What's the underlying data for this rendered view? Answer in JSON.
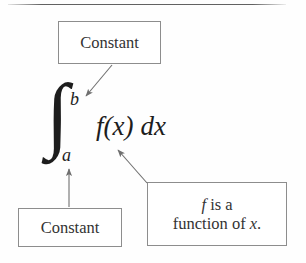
{
  "figure": {
    "background_color": "#fefefe",
    "rule_color": "#4a4a4a",
    "box_border_color": "#8d8d8d",
    "arrow_color": "#6f6f6f",
    "text_color": "#2b2b2b"
  },
  "expression": {
    "integral_sign": "∫",
    "upper_limit": "b",
    "lower_limit": "a",
    "integrand": "f(x)",
    "differential": "dx"
  },
  "callouts": {
    "upper_limit": {
      "label": "Constant",
      "lines": [
        "Constant"
      ]
    },
    "lower_limit": {
      "label": "Constant",
      "lines": [
        "Constant"
      ]
    },
    "integrand": {
      "label": "f is a function of x.",
      "lines": [
        "f is a",
        "function of x."
      ],
      "line1_italic": "f",
      "line1_rest": " is a",
      "line2_rest": "function of ",
      "line2_italic": "x",
      "line2_period": "."
    }
  },
  "arrows": [
    {
      "name": "arrow-upper-limit",
      "from": "Constant box (top)",
      "to": "upper limit b"
    },
    {
      "name": "arrow-lower-limit",
      "from": "Constant box (bottom left)",
      "to": "lower limit a"
    },
    {
      "name": "arrow-integrand",
      "from": "f is a function of x box",
      "to": "f(x)"
    }
  ]
}
